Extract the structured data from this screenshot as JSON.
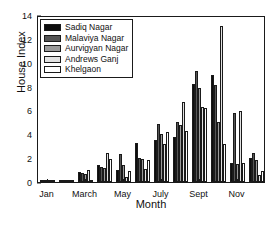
{
  "chart_data": {
    "type": "bar",
    "title": "",
    "xlabel": "Month",
    "ylabel": "House Index",
    "ylim": [
      0,
      14
    ],
    "yticks": [
      0,
      2,
      4,
      6,
      8,
      10,
      12,
      14
    ],
    "grid": false,
    "legend_position": "top-left",
    "categories": [
      "Jan",
      "Feb",
      "March",
      "April",
      "May",
      "June",
      "July",
      "Aug",
      "Sept",
      "Oct",
      "Nov",
      "Dec"
    ],
    "xtick_labels": [
      "Jan",
      "March",
      "May",
      "July",
      "Sept",
      "Nov"
    ],
    "xtick_categories": [
      "Jan",
      "March",
      "May",
      "July",
      "Sept",
      "Nov"
    ],
    "series": [
      {
        "name": "Sadiq Nagar",
        "color": "#0d0d0d",
        "values": [
          0.08,
          0.05,
          0.8,
          1.4,
          1.0,
          3.3,
          3.5,
          3.8,
          8.2,
          9.0,
          1.6,
          2.0
        ]
      },
      {
        "name": "Malaviya Nagar",
        "color": "#555555",
        "values": [
          0.06,
          0.04,
          0.75,
          1.25,
          2.35,
          2.0,
          4.85,
          5.0,
          9.3,
          8.1,
          5.75,
          2.4
        ]
      },
      {
        "name": "Aurvigyan Nagar",
        "color": "#9a9a9a",
        "values": [
          0.05,
          0.03,
          0.7,
          1.2,
          1.4,
          1.9,
          4.0,
          4.75,
          7.9,
          5.0,
          1.55,
          1.85
        ]
      },
      {
        "name": "Andrews Ganj",
        "color": "#e2e2e2",
        "values": [
          0.04,
          0.03,
          1.0,
          2.45,
          0.45,
          1.1,
          3.2,
          6.7,
          6.25,
          13.05,
          5.95,
          0.55
        ]
      },
      {
        "name": "Khelgaon",
        "color": "#ffffff",
        "values": [
          0.03,
          0.02,
          0.1,
          1.95,
          0.9,
          1.85,
          4.2,
          4.3,
          6.2,
          3.15,
          1.6,
          0.95
        ]
      }
    ]
  },
  "legend": {
    "entries": [
      {
        "label": "Sadiq Nagar"
      },
      {
        "label": "Malaviya Nagar"
      },
      {
        "label": "Aurvigyan Nagar"
      },
      {
        "label": "Andrews Ganj"
      },
      {
        "label": "Khelgaon"
      }
    ]
  },
  "axes": {
    "y_label": "House Index",
    "x_label": "Month"
  }
}
